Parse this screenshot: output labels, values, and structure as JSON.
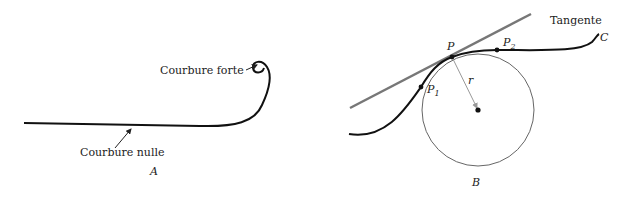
{
  "panel_a": {
    "label": "A",
    "annotations": {
      "strong": "Courbure forte",
      "zero": "Courbure nulle"
    }
  },
  "panel_b": {
    "label": "B",
    "curve_label": "C",
    "tangent_label": "Tangente",
    "points": {
      "p": "P",
      "p1": "P",
      "p1_sub": "1",
      "p2": "P",
      "p2_sub": "2"
    },
    "radius_label": "r"
  },
  "colors": {
    "curve": "#111111",
    "tangent": "#777777",
    "circle": "#666666",
    "radius": "#999999"
  }
}
